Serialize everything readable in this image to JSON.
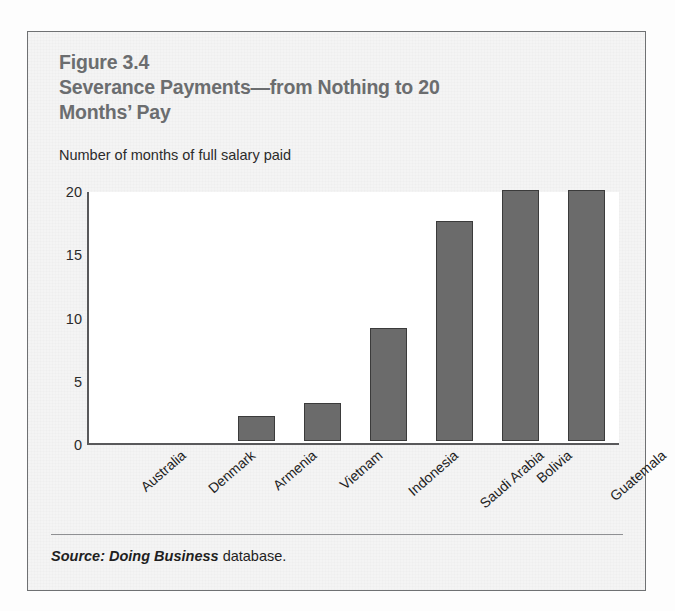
{
  "figure": {
    "number_label": "Figure 3.4",
    "title_line_1": "Severance Payments—from Nothing to 20",
    "title_line_2": "Months’ Pay",
    "subtitle": "Number of months of full salary paid",
    "source_italic": "Source: Doing Business",
    "source_plain": "database.",
    "title_color": "#6b6d6f",
    "bar_color": "#6b6b6b",
    "bar_border_color": "#3b3b3b",
    "axis_color": "#59595b",
    "plot_background": "#ffffff",
    "panel_background": "#f4f4f4",
    "panel_border_color": "#6f7173"
  },
  "chart_data": {
    "type": "bar",
    "title": "Figure 3.4 Severance Payments—from Nothing to 20 Months’ Pay",
    "subtitle": "Number of months of full salary paid",
    "xlabel": "",
    "ylabel": "Number of months of full salary paid",
    "categories": [
      "Australia",
      "Denmark",
      "Armenia",
      "Vietnam",
      "Indonesia",
      "Saudi Arabia",
      "Bolivia",
      "Guatemala"
    ],
    "values": [
      0,
      0,
      2,
      3,
      9,
      17.5,
      20,
      20
    ],
    "ylim": [
      0,
      20
    ],
    "yticks": [
      0,
      5,
      10,
      15,
      20
    ],
    "ytick_labels": [
      "0",
      "5",
      "10",
      "15",
      "20"
    ],
    "grid": false,
    "legend": false,
    "series": [
      {
        "name": "Months of full salary paid",
        "values": [
          0,
          0,
          2,
          3,
          9,
          17.5,
          20,
          20
        ]
      }
    ],
    "source": "Source: Doing Business database."
  }
}
